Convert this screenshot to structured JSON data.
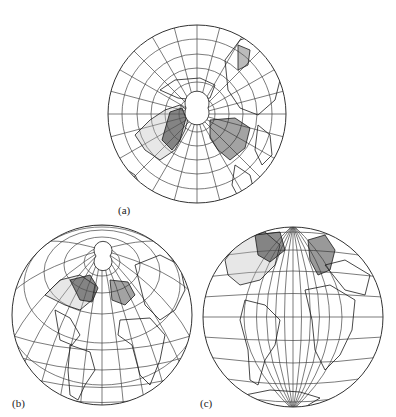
{
  "figure": {
    "panels": [
      {
        "id": "a",
        "label": "(a)",
        "projection": "polar-centered globe",
        "center": [
          197,
          114
        ],
        "radius": 89,
        "label_pos": [
          113,
          206
        ]
      },
      {
        "id": "b",
        "label": "(b)",
        "projection": "oblique globe (North Atlantic)",
        "center": [
          102,
          315
        ],
        "radius": 90,
        "label_pos": [
          8,
          398
        ]
      },
      {
        "id": "c",
        "label": "(c)",
        "projection": "equatorial globe (Atlantic)",
        "center": [
          293,
          317
        ],
        "radius": 90,
        "label_pos": [
          198,
          398
        ]
      }
    ],
    "colors": {
      "line": "#3a3a3a",
      "land": "#1a1a1a",
      "background": "#ffffff"
    }
  }
}
